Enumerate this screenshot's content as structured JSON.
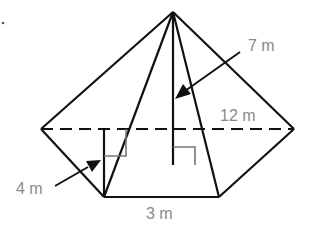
{
  "figure": {
    "type": "square-based pyramid composed with triangular faces (composite solid net view)",
    "colors": {
      "edge": "#111111",
      "marker": "#777777",
      "label": "#8a8a8a",
      "background": "#ffffff"
    },
    "labels": {
      "height": "7 m",
      "width": "12 m",
      "side_height": "4 m",
      "base": "3 m"
    },
    "vertices": {
      "apex": [
        173,
        12
      ],
      "left": [
        41,
        129
      ],
      "right": [
        294,
        129
      ],
      "bottom_left": [
        104,
        197
      ],
      "bottom_right": [
        219,
        197
      ]
    }
  }
}
